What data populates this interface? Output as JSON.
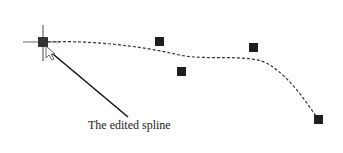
{
  "diagram": {
    "caption": "The edited spline",
    "colors": {
      "stroke": "#222222",
      "point": "#1e1e1e",
      "cursor": "#555555"
    },
    "spline_path": "M 43 42 C 90 40, 140 46, 175 54 C 205 62, 250 52, 270 65 C 290 78, 305 100, 318 119",
    "control_points": [
      {
        "x": 159,
        "y": 41
      },
      {
        "x": 181,
        "y": 71
      },
      {
        "x": 253,
        "y": 47
      },
      {
        "x": 318,
        "y": 119
      }
    ],
    "start_point": {
      "x": 43,
      "y": 42
    },
    "leader_line": {
      "x1": 47,
      "y1": 49,
      "x2": 128,
      "y2": 117
    }
  }
}
